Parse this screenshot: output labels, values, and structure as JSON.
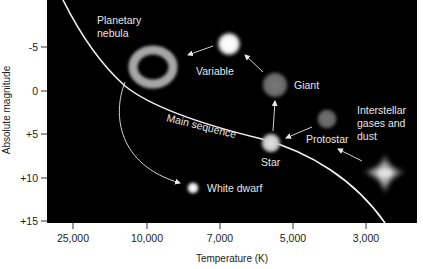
{
  "diagram": {
    "x_axis": {
      "title": "Temperature (K)",
      "ticks": [
        "25,000",
        "10,000",
        "7,000",
        "5,000",
        "3,000"
      ]
    },
    "y_axis": {
      "title": "Absolute magnitude",
      "ticks": [
        "-5",
        "0",
        "+5",
        "+10",
        "+15"
      ]
    },
    "curve_label": "Main sequence",
    "stages": {
      "interstellar": [
        "Interstellar",
        "gases and",
        "dust"
      ],
      "protostar": "Protostar",
      "star": "Star",
      "giant": "Giant",
      "variable": "Variable",
      "planetary_nebula": [
        "Planetary",
        "nebula"
      ],
      "white_dwarf": "White dwarf"
    },
    "sequence": [
      "Interstellar gases and dust",
      "Protostar",
      "Star",
      "Giant",
      "Variable",
      "Planetary nebula",
      "White dwarf"
    ],
    "colors": {
      "background": "#000000",
      "curve": "#f2f2f2",
      "arrows": "#e8e8e8",
      "giant": "#6e6e6e",
      "protostar": "#6a6a6a",
      "star": "#cfcfcf",
      "variable": "#ffffff",
      "white_dwarf": "#ffffff",
      "nebula": "#a8a8a8",
      "cloud": "#bdbdbd"
    }
  }
}
